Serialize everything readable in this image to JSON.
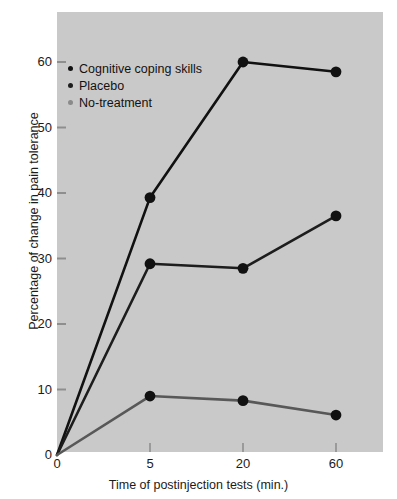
{
  "chart_data": {
    "type": "line",
    "title": "",
    "subtitle": "",
    "xlabel": "Time of postinjection tests (min.)",
    "ylabel": "Percentage of change in pain tolerance",
    "categories": [
      "0",
      "5",
      "20",
      "60"
    ],
    "xticks": [
      "0",
      "5",
      "20",
      "60"
    ],
    "yticks": [
      "0",
      "10",
      "20",
      "30",
      "40",
      "50",
      "60"
    ],
    "ylim": [
      0,
      67
    ],
    "grid": false,
    "legend_position": "upper-left-inside",
    "series": [
      {
        "name": "Cognitive coping skills",
        "color": "#111111",
        "values": [
          0,
          39.3,
          60.0,
          58.5
        ]
      },
      {
        "name": "Placebo",
        "color": "#1d1d1d",
        "values": [
          0,
          29.2,
          28.5,
          36.5
        ]
      },
      {
        "name": "No-treatment",
        "color": "#585858",
        "values": [
          0,
          9.0,
          8.3,
          6.1
        ]
      }
    ],
    "plot_background": "#c9c9c9",
    "figure_background": "#ffffff"
  },
  "axes": {
    "y_title": "Percentage of change in pain tolerance",
    "x_title": "Time of postinjection tests (min.)"
  },
  "legend": {
    "items": [
      {
        "label": "Cognitive coping skills",
        "color": "#111111"
      },
      {
        "label": "Placebo",
        "color": "#1d1d1d"
      },
      {
        "label": "No-treatment",
        "color": "#8a8a8a"
      }
    ]
  }
}
